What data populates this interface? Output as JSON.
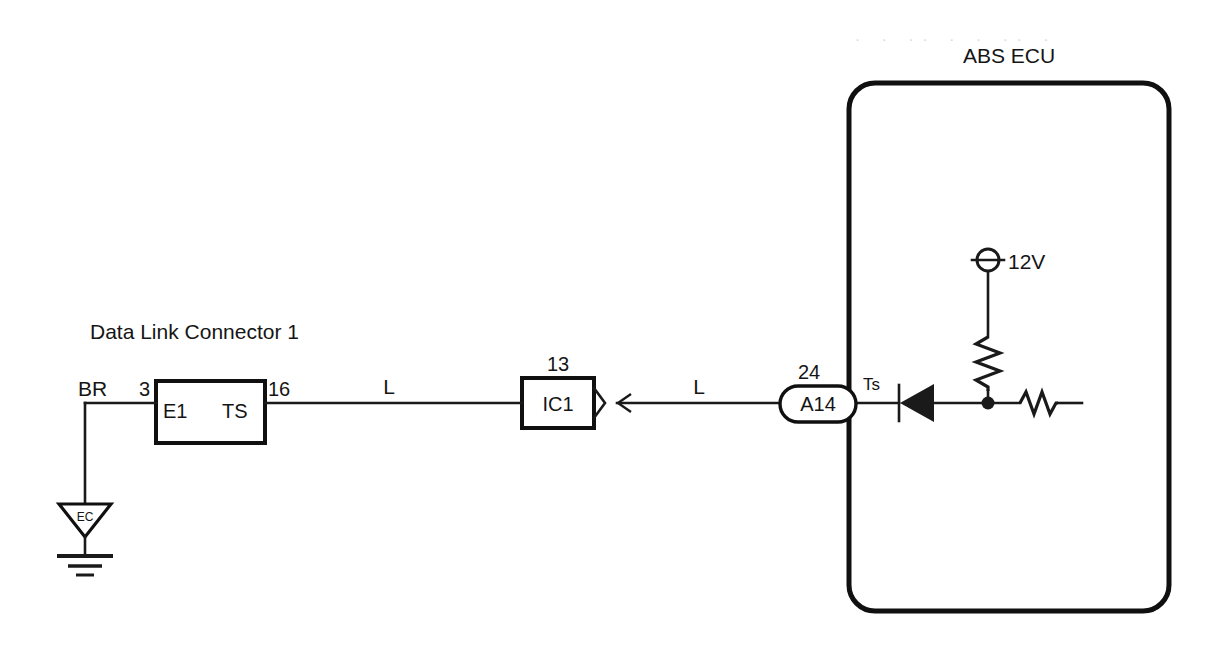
{
  "diagram": {
    "title": "ABS ECU",
    "connector_label": "Data Link Connector 1",
    "wire_color_left": "BR",
    "wire_color_mid": "L",
    "wire_color_right": "L",
    "pins": {
      "e1_number": "3",
      "e1_name": "E1",
      "ts_name": "TS",
      "ts_number": "16"
    },
    "junction_block": {
      "number": "13",
      "name": "IC1"
    },
    "ecu_connector": {
      "number": "24",
      "name": "A14",
      "terminal": "Ts"
    },
    "ground": {
      "code": "EC"
    },
    "supply": {
      "voltage": "12V"
    },
    "artifact_text": "· ·  ·· · ·  ·· ·"
  }
}
